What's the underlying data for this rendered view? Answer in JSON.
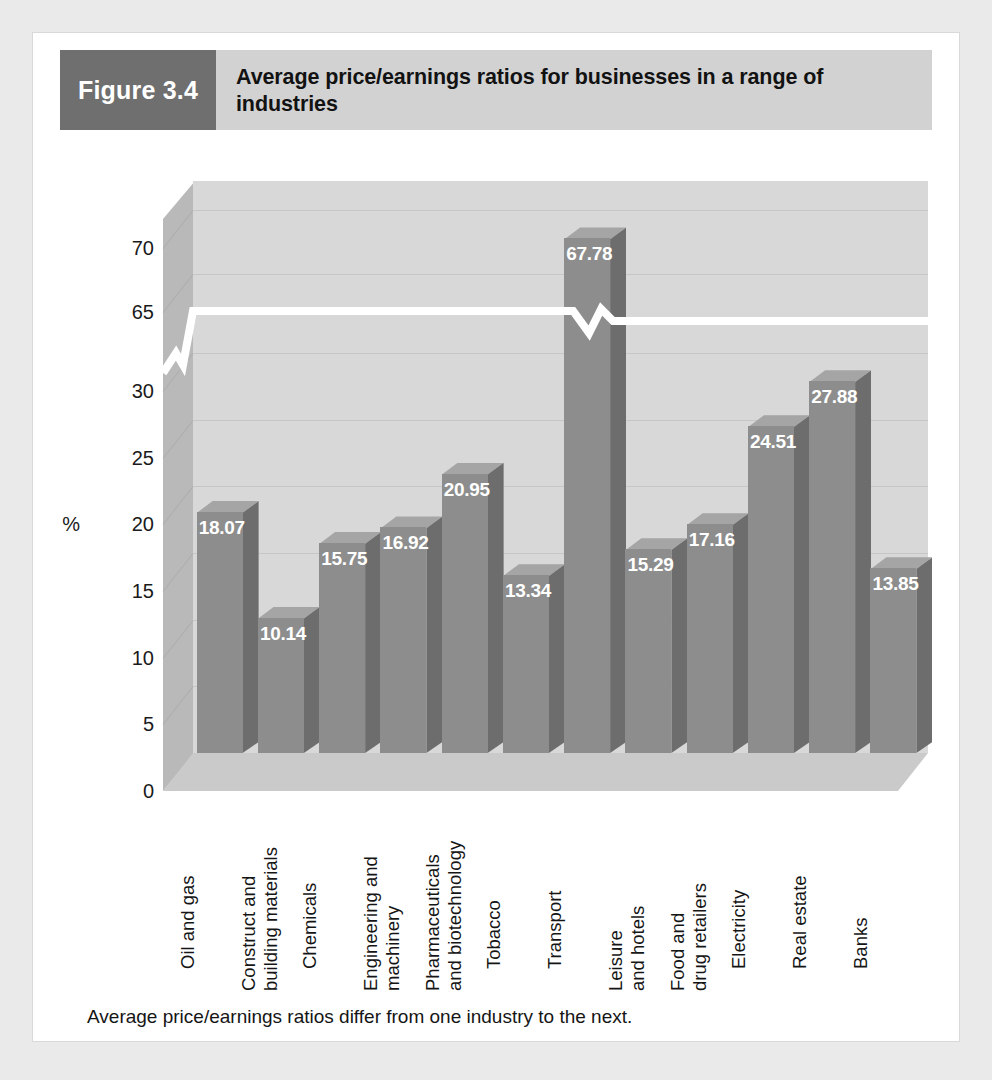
{
  "figure": {
    "tag": "Figure 3.4",
    "title": "Average price/earnings ratios for businesses in a range of industries",
    "caption": "Average price/earnings ratios differ from one industry to the next.",
    "axis_unit": "%"
  },
  "colors": {
    "tag_background": "#6f6f6f",
    "header_background": "#d2d2d2",
    "bar_front": "#8d8d8d",
    "bar_side": "#6d6d6d",
    "plot_background": "#d8d8d8",
    "page_background": "#eaeaea",
    "card_background": "#ffffff",
    "label_text": "#ffffff",
    "axis_text": "#1a1a1a"
  },
  "chart_data": {
    "type": "bar",
    "title": "Average price/earnings ratios for businesses in a range of industries",
    "xlabel": "",
    "ylabel": "%",
    "grid": true,
    "legend_position": "none",
    "axis_break": {
      "present": true,
      "between": [
        30,
        65
      ],
      "marker": "zigzag"
    },
    "yticks": [
      0,
      5,
      10,
      15,
      20,
      25,
      30,
      65,
      70
    ],
    "ylim": [
      0,
      70
    ],
    "categories": [
      "Oil and gas",
      "Construct and building materials",
      "Chemicals",
      "Engineering and machinery",
      "Pharmaceuticals and biotechnology",
      "Tobacco",
      "Transport",
      "Leisure and hotels",
      "Food and drug retailers",
      "Electricity",
      "Real estate",
      "Banks"
    ],
    "values": [
      18.07,
      10.14,
      15.75,
      16.92,
      20.95,
      13.34,
      67.78,
      15.29,
      17.16,
      24.51,
      27.88,
      13.85
    ],
    "value_labels": [
      "18.07",
      "10.14",
      "15.75",
      "16.92",
      "20.95",
      "13.34",
      "67.78",
      "15.29",
      "17.16",
      "24.51",
      "27.88",
      "13.85"
    ]
  },
  "x_label_lines": [
    [
      "Oil and gas"
    ],
    [
      "Construct and",
      "building materials"
    ],
    [
      "Chemicals"
    ],
    [
      "Engineering and",
      "machinery"
    ],
    [
      "Pharmaceuticals",
      "and biotechnology"
    ],
    [
      "Tobacco"
    ],
    [
      "Transport"
    ],
    [
      "Leisure",
      "and hotels"
    ],
    [
      "Food and",
      "drug retailers"
    ],
    [
      "Electricity"
    ],
    [
      "Real estate"
    ],
    [
      "Banks"
    ]
  ]
}
